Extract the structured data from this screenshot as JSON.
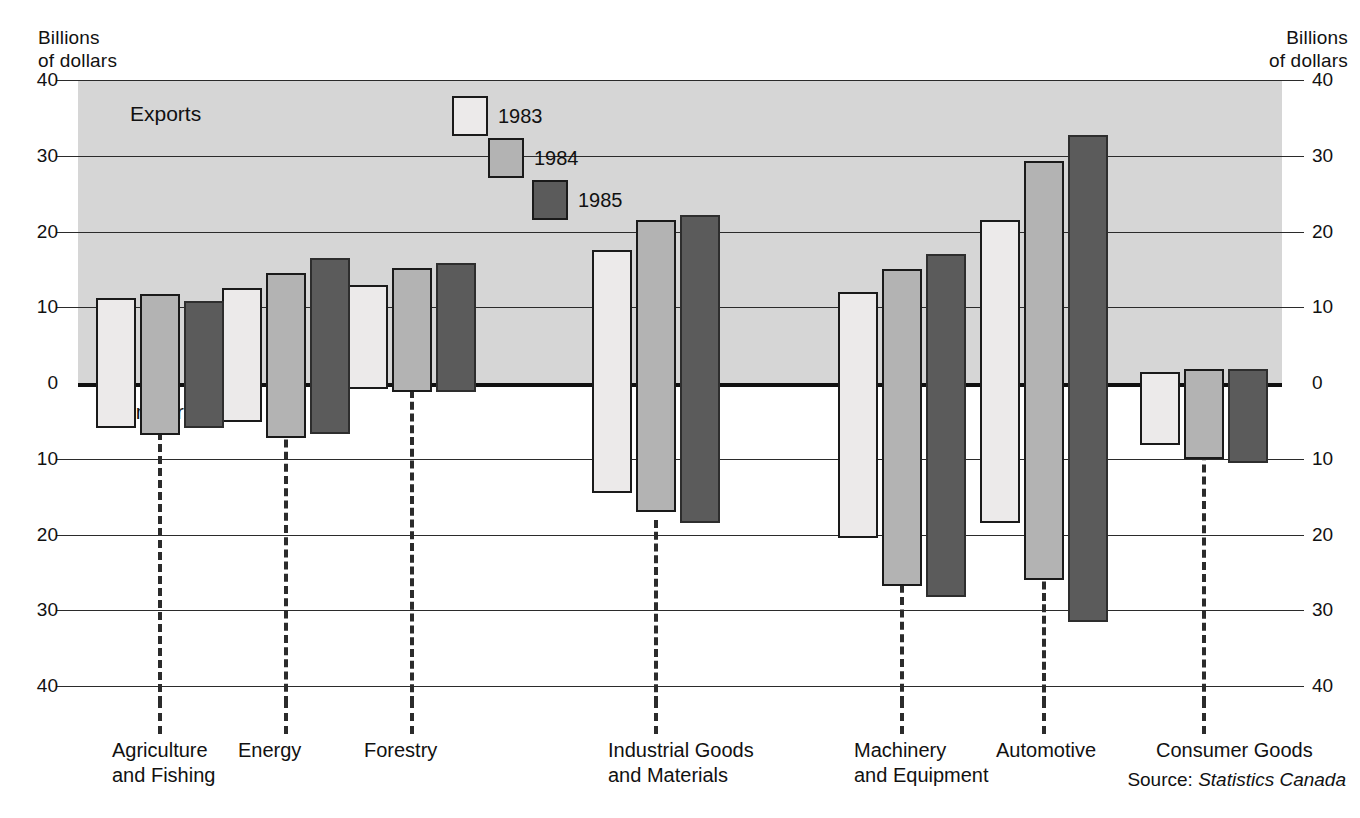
{
  "chart_data": {
    "type": "bar",
    "title": "",
    "subtitle": "",
    "xlabel": "",
    "ylabel": "Billions of dollars",
    "axis_caption": "Billions\nof dollars",
    "ylim": [
      -40,
      40
    ],
    "y_ticks_upper": [
      "40",
      "30",
      "20",
      "10",
      "0"
    ],
    "y_ticks_lower": [
      "10",
      "20",
      "30",
      "40"
    ],
    "grid": true,
    "legend_position": "top-center",
    "region_labels": {
      "upper": "Exports",
      "lower": "Imports"
    },
    "series_names": [
      "1983",
      "1984",
      "1985"
    ],
    "series_colors": [
      "#eceaea",
      "#b3b3b3",
      "#5b5b5b"
    ],
    "categories": [
      "Agriculture\nand Fishing",
      "Energy",
      "Forestry",
      "Industrial Goods\nand Materials",
      "Machinery\nand Equipment",
      "Automotive",
      "Consumer Goods"
    ],
    "series": [
      {
        "name": "1983",
        "exports": [
          11.2,
          12.5,
          13.0,
          17.6,
          12.0,
          21.5,
          1.5
        ],
        "imports": [
          6.0,
          5.2,
          0.8,
          14.5,
          20.5,
          18.5,
          8.2
        ]
      },
      {
        "name": "1984",
        "exports": [
          11.8,
          14.5,
          15.2,
          21.5,
          15.1,
          29.3,
          1.8
        ],
        "imports": [
          6.8,
          7.3,
          1.2,
          17.0,
          26.8,
          26.0,
          10.0
        ]
      },
      {
        "name": "1985",
        "exports": [
          10.8,
          16.5,
          15.8,
          22.2,
          17.0,
          32.8,
          1.9
        ],
        "imports": [
          6.0,
          6.8,
          1.2,
          18.5,
          28.2,
          31.5,
          10.6
        ]
      }
    ],
    "source_prefix": "Source:",
    "source_name": "Statistics Canada"
  },
  "legend": {
    "items": [
      {
        "label": "1983",
        "color": "#eceaea"
      },
      {
        "label": "1984",
        "color": "#b3b3b3"
      },
      {
        "label": "1985",
        "color": "#5b5b5b"
      }
    ]
  }
}
